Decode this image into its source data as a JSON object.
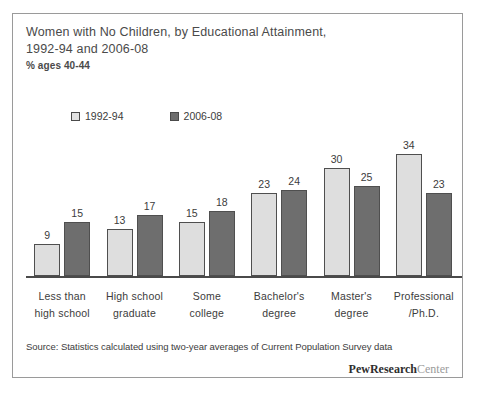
{
  "figure": {
    "title_line_1": "Women with No Children, by Educational Attainment,",
    "title_line_2": "1992-94 and 2006-08",
    "subtitle": "% ages 40-44",
    "source_note": "Source: Statistics calculated using two-year averages of Current Population Survey data",
    "brand_bold": "PewResearch",
    "brand_light": "Center"
  },
  "chart_data": {
    "type": "bar",
    "title": "Women with No Children, by Educational Attainment, 1992-94 and 2006-08",
    "subtitle": "% ages 40-44",
    "xlabel": "",
    "ylabel": "% ages 40-44",
    "ylim": [
      0,
      40
    ],
    "grid": false,
    "legend_position": "top-left",
    "categories": [
      "Less than high school",
      "High school graduate",
      "Some college",
      "Bachelor's degree",
      "Master's degree",
      "Professional /Ph.D."
    ],
    "category_lines": [
      [
        "Less than",
        "high school"
      ],
      [
        "High school",
        "graduate"
      ],
      [
        "Some",
        "college"
      ],
      [
        "Bachelor's",
        "degree"
      ],
      [
        "Master's",
        "degree"
      ],
      [
        "Professional",
        "/Ph.D."
      ]
    ],
    "series": [
      {
        "name": "1992-94",
        "color": "#dedede",
        "values": [
          9,
          13,
          15,
          23,
          30,
          34
        ]
      },
      {
        "name": "2006-08",
        "color": "#6e6e6e",
        "values": [
          15,
          17,
          18,
          24,
          25,
          23
        ]
      }
    ]
  },
  "legend": {
    "items": [
      {
        "label": "1992-94",
        "swatch": "light"
      },
      {
        "label": "2006-08",
        "swatch": "dark"
      }
    ]
  }
}
